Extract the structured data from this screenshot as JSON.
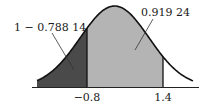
{
  "diagram": {
    "type": "standard-normal-curve-shaded-areas",
    "axis": {
      "ticks": [
        {
          "value": -0.8,
          "label": "−0.8"
        },
        {
          "value": 1.4,
          "label": "1.4"
        }
      ]
    },
    "regions": [
      {
        "name": "left-tail",
        "from": "-inf",
        "to": -0.8,
        "color": "#4a4a4a"
      },
      {
        "name": "middle",
        "from": -0.8,
        "to": 1.4,
        "color": "#b4b4b4"
      }
    ],
    "annotations": {
      "left_tail_area": "1 − 0.788 14",
      "cumulative_area": "0.919 24"
    },
    "colors": {
      "curve": "#111111",
      "axis": "#222222",
      "dark_fill": "#4a4a4a",
      "light_fill": "#b4b4b4",
      "background": "#ffffff"
    }
  }
}
